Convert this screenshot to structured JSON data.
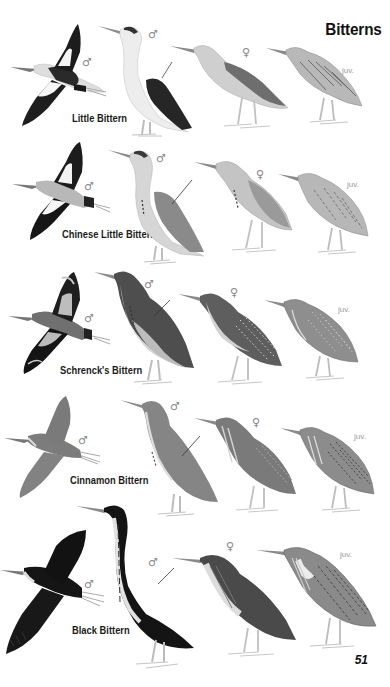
{
  "page": {
    "title": "Bitterns",
    "page_number": "51"
  },
  "plates": [
    {
      "species": "Little Bittern",
      "figures": [
        {
          "pose": "flight",
          "label": "♂"
        },
        {
          "pose": "standing",
          "label": "♂"
        },
        {
          "pose": "standing",
          "label": "♀"
        },
        {
          "pose": "standing",
          "label": "juv."
        }
      ],
      "colors": {
        "back": "#2a2a2a",
        "body": "#e8e8e8",
        "wing_patch": "#f2f2f2",
        "neck": "#dcdcdc",
        "female_back": "#6e6e6e",
        "juv_body": "#bdbdbd"
      }
    },
    {
      "species": "Chinese Little Bittern",
      "figures": [
        {
          "pose": "flight",
          "label": "♂"
        },
        {
          "pose": "standing",
          "label": "♂"
        },
        {
          "pose": "standing",
          "label": "♀"
        },
        {
          "pose": "standing",
          "label": "juv."
        }
      ],
      "colors": {
        "back": "#8c8c8c",
        "body": "#c8c8c8",
        "wing_patch": "#e6e6e6",
        "neck": "#cfcfcf",
        "female_back": "#9a9a9a",
        "juv_body": "#b7b7b7"
      }
    },
    {
      "species": "Schrenck's Bittern",
      "figures": [
        {
          "pose": "flight",
          "label": "♂"
        },
        {
          "pose": "standing",
          "label": "♂"
        },
        {
          "pose": "standing",
          "label": "♀"
        },
        {
          "pose": "standing",
          "label": "juv."
        }
      ],
      "colors": {
        "back": "#4e4e4e",
        "body": "#bcbcbc",
        "wing_patch": "#c4c4c4",
        "neck": "#7a7a7a",
        "female_back": "#5e5e5e",
        "juv_body": "#8e8e8e"
      }
    },
    {
      "species": "Cinnamon Bittern",
      "figures": [
        {
          "pose": "flight",
          "label": "♂"
        },
        {
          "pose": "standing",
          "label": "♂"
        },
        {
          "pose": "standing",
          "label": "♀"
        },
        {
          "pose": "standing",
          "label": "juv."
        }
      ],
      "colors": {
        "back": "#7c7c7c",
        "body": "#858585",
        "wing_patch": "#7f7f7f",
        "neck": "#8a8a8a",
        "female_back": "#7a7a7a",
        "juv_body": "#8c8c8c"
      }
    },
    {
      "species": "Black Bittern",
      "figures": [
        {
          "pose": "flight",
          "label": "♂"
        },
        {
          "pose": "standing",
          "label": "♂"
        },
        {
          "pose": "standing",
          "label": "♀"
        },
        {
          "pose": "standing",
          "label": "juv."
        }
      ],
      "colors": {
        "back": "#141414",
        "body": "#1c1c1c",
        "wing_patch": "#222222",
        "neck": "#e0e0e0",
        "female_back": "#4a4a4a",
        "juv_body": "#8a8a8a"
      }
    }
  ]
}
